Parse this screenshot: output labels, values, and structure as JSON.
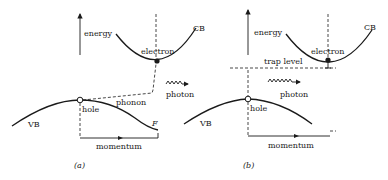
{
  "figure": {
    "panels": [
      {
        "id": "a",
        "caption": "(a)",
        "labels": {
          "energy": "energy",
          "cb": "CB",
          "vb": "VB",
          "electron": "electron",
          "hole": "hole",
          "phonon": "phonon",
          "photon": "photon",
          "momentum": "momentum",
          "f": "F"
        }
      },
      {
        "id": "b",
        "caption": "(b)",
        "labels": {
          "energy": "energy",
          "cb": "CB",
          "vb": "VB",
          "electron": "electron",
          "hole": "hole",
          "trap_level": "trap level",
          "photon": "photon",
          "momentum": "momentum"
        }
      }
    ]
  }
}
